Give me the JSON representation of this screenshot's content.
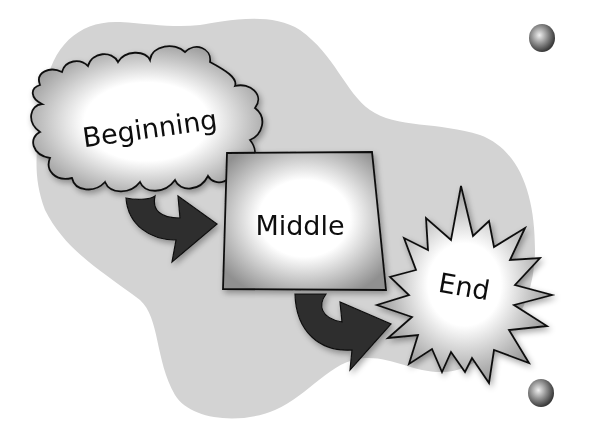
{
  "diagram": {
    "type": "story-sequence flow",
    "colors": {
      "background": "#ffffff",
      "blob": "#d3d3d3",
      "shape_fill_center": "#ffffff",
      "shape_fill_edge": "#9a9a9a",
      "arrow": "#2f2f2f",
      "stroke": "#111111"
    },
    "nodes": [
      {
        "id": "beginning",
        "shape": "cloud",
        "label": "Beginning"
      },
      {
        "id": "middle",
        "shape": "square",
        "label": "Middle"
      },
      {
        "id": "end",
        "shape": "starburst",
        "label": "End"
      }
    ],
    "edges": [
      {
        "from": "beginning",
        "to": "middle",
        "icon": "curved-arrow-icon"
      },
      {
        "from": "middle",
        "to": "end",
        "icon": "curved-arrow-icon"
      }
    ],
    "decorations": [
      {
        "icon": "sphere-icon",
        "position": "top-right"
      },
      {
        "icon": "sphere-icon",
        "position": "bottom-right"
      }
    ]
  }
}
